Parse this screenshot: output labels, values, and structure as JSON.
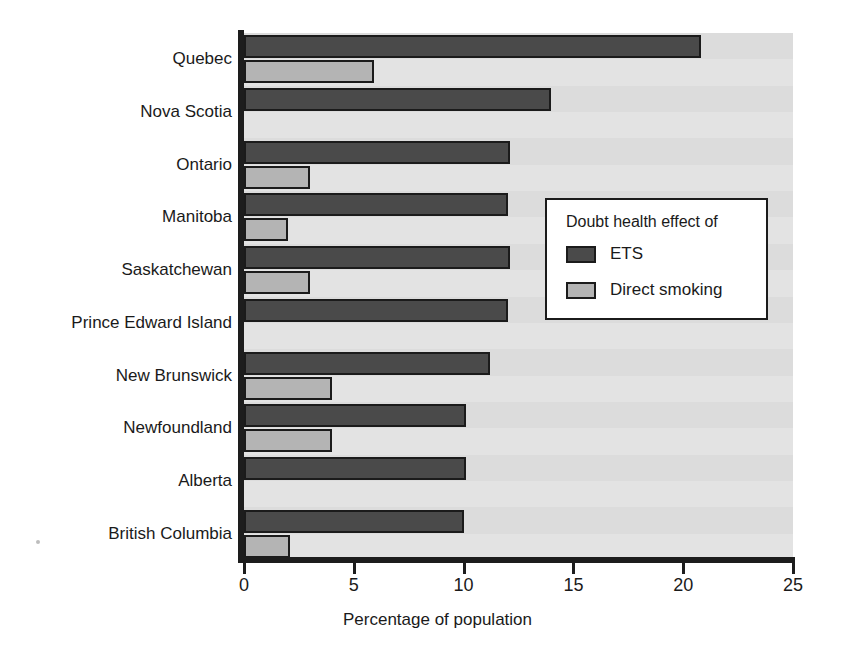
{
  "chart_data": {
    "type": "bar",
    "orientation": "horizontal",
    "title": "",
    "xlabel": "Percentage of population",
    "ylabel": "",
    "xlim": [
      0,
      25
    ],
    "xticks": [
      0,
      5,
      10,
      15,
      20,
      25
    ],
    "xtick_labels": [
      "0",
      "5",
      "10",
      "15",
      "20",
      "25"
    ],
    "grid": false,
    "legend_position": "center-right",
    "legend_title": "Doubt health effect of",
    "categories": [
      "Quebec",
      "Nova Scotia",
      "Ontario",
      "Manitoba",
      "Saskatchewan",
      "Prince Edward Island",
      "New Brunswick",
      "Newfoundland",
      "Alberta",
      "British Columbia"
    ],
    "series": [
      {
        "name": "ETS",
        "color": "#4a4a4a",
        "values": [
          20.8,
          14.0,
          12.1,
          12.0,
          12.1,
          12.0,
          11.2,
          10.1,
          10.1,
          10.0
        ]
      },
      {
        "name": "Direct smoking",
        "color": "#b4b4b4",
        "values": [
          5.9,
          0.0,
          3.0,
          2.0,
          3.0,
          0.0,
          4.0,
          4.0,
          0.0,
          2.1
        ]
      }
    ]
  },
  "legend": {
    "title": "Doubt health effect of",
    "entries": [
      {
        "label": "ETS",
        "color": "#4a4a4a"
      },
      {
        "label": "Direct smoking",
        "color": "#b4b4b4"
      }
    ]
  },
  "axis": {
    "x_title": "Percentage of population",
    "tick_labels": [
      "0",
      "5",
      "10",
      "15",
      "20",
      "25"
    ]
  },
  "colors": {
    "ets": "#4a4a4a",
    "direct_smoking": "#b4b4b4",
    "plot_background": "#e3e3e3",
    "axis": "#1d1d1d",
    "legend_background": "#ffffff"
  }
}
